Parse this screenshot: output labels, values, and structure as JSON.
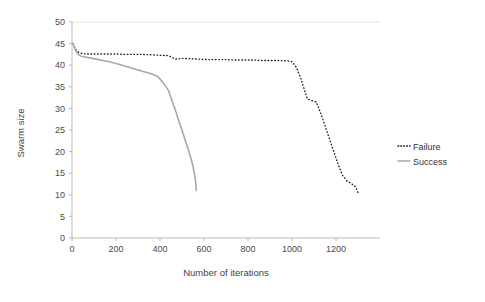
{
  "chart_data": {
    "type": "line",
    "title": "",
    "xlabel": "Number of iterations",
    "ylabel": "Swarm size",
    "xlim": [
      0,
      1400
    ],
    "ylim": [
      0,
      50
    ],
    "xticks": [
      0,
      200,
      400,
      600,
      800,
      1000,
      1200
    ],
    "yticks": [
      0,
      5,
      10,
      15,
      20,
      25,
      30,
      35,
      40,
      45,
      50
    ],
    "grid": "horizontal-top-only",
    "legend_position": "right",
    "colors": {
      "failure": "#1a1a1a",
      "success": "#a8a8a8",
      "axis": "#b9b9b9",
      "background": "#ffffff"
    },
    "series": [
      {
        "name": "Failure",
        "style": "dotted",
        "color": "#1a1a1a",
        "x": [
          5,
          12,
          20,
          30,
          45,
          60,
          80,
          100,
          130,
          160,
          200,
          240,
          280,
          320,
          360,
          400,
          440,
          470,
          500,
          540,
          580,
          620,
          660,
          700,
          740,
          780,
          820,
          860,
          900,
          940,
          980,
          1000,
          1020,
          1040,
          1055,
          1070,
          1090,
          1110,
          1130,
          1150,
          1170,
          1190,
          1210,
          1230,
          1250,
          1270,
          1290,
          1300
        ],
        "y": [
          45.0,
          44.2,
          43.4,
          43.0,
          42.7,
          42.6,
          42.6,
          42.6,
          42.6,
          42.6,
          42.6,
          42.5,
          42.5,
          42.5,
          42.4,
          42.3,
          42.2,
          41.4,
          41.6,
          41.5,
          41.4,
          41.3,
          41.3,
          41.3,
          41.2,
          41.2,
          41.2,
          41.1,
          41.1,
          41.1,
          41.0,
          40.8,
          39.5,
          37.0,
          34.5,
          32.2,
          31.8,
          31.5,
          29.0,
          26.0,
          23.0,
          20.0,
          17.0,
          14.5,
          13.2,
          12.6,
          11.8,
          10.5
        ]
      },
      {
        "name": "Success",
        "style": "solid",
        "color": "#a8a8a8",
        "x": [
          5,
          12,
          20,
          30,
          45,
          60,
          80,
          110,
          140,
          170,
          200,
          240,
          280,
          320,
          360,
          390,
          410,
          425,
          440,
          450,
          460,
          470,
          480,
          490,
          500,
          510,
          520,
          530,
          540,
          550,
          558,
          563,
          565
        ],
        "y": [
          45.0,
          44.0,
          43.0,
          42.4,
          42.0,
          41.9,
          41.7,
          41.4,
          41.1,
          40.8,
          40.4,
          39.8,
          39.2,
          38.6,
          38.0,
          37.4,
          36.2,
          35.2,
          34.0,
          32.4,
          31.0,
          29.6,
          28.0,
          26.4,
          25.0,
          23.4,
          21.8,
          20.2,
          18.6,
          16.6,
          14.4,
          12.4,
          11.0
        ]
      }
    ]
  },
  "legend": {
    "items": [
      {
        "label": "Failure",
        "style": "dotted"
      },
      {
        "label": "Success",
        "style": "solid"
      }
    ]
  }
}
